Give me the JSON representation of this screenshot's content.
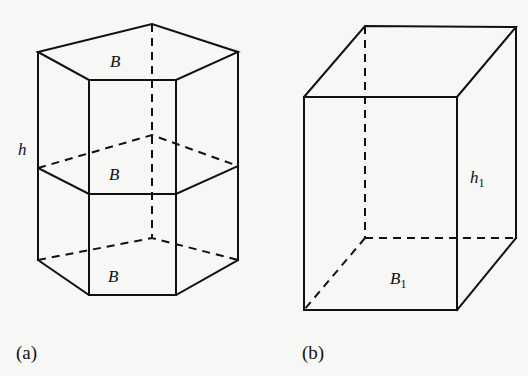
{
  "figure_a": {
    "caption": "(a)",
    "shape": "pentagonal prism",
    "base_label_top": "B",
    "base_label_middle": "B",
    "base_label_bottom": "B",
    "height_label": "h"
  },
  "figure_b": {
    "caption": "(b)",
    "shape": "rectangular box",
    "base_label": "B",
    "base_label_sub": "1",
    "height_label": "h",
    "height_label_sub": "1"
  },
  "colors": {
    "line": "#111111",
    "background": "#f7f7f5"
  }
}
